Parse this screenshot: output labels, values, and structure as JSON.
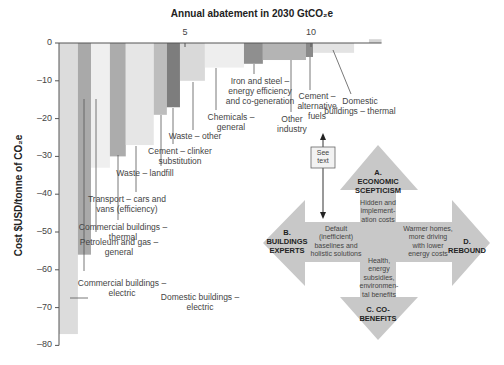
{
  "chart_data": {
    "type": "bar",
    "subtype": "marginal-abatement-cost-curve",
    "title": "Annual abatement in 2030 GtCO₂e",
    "xlabel": "Annual abatement in 2030 GtCO₂e",
    "ylabel": "Cost $USD/tonne of CO₂e",
    "x_ticks": [
      5,
      10
    ],
    "y_ticks": [
      0,
      -10,
      -20,
      -30,
      -40,
      -50,
      -60,
      -70,
      -80
    ],
    "ylim": [
      -80,
      2
    ],
    "xlim": [
      0,
      12.8
    ],
    "grid": false,
    "bars": [
      {
        "label": "Domestic buildings – electric",
        "x_start": 0.0,
        "width": 0.75,
        "value": -77,
        "color": "#dcdcdc"
      },
      {
        "label": "Commercial buildings – electric",
        "x_start": 0.75,
        "width": 0.52,
        "value": -56,
        "color": "#a9a9a9"
      },
      {
        "label": "Petroleum and gas – general",
        "x_start": 1.27,
        "width": 0.75,
        "value": -33,
        "color": "#efefef"
      },
      {
        "label": "Commercial buildings – thermal",
        "x_start": 2.02,
        "width": 0.63,
        "value": -30,
        "color": "#acacac"
      },
      {
        "label": "Transport – cars and vans (efficiency)",
        "x_start": 2.65,
        "width": 1.11,
        "value": -27,
        "color": "#e6e6e6"
      },
      {
        "label": "Waste – landfill",
        "x_start": 3.76,
        "width": 0.52,
        "value": -19,
        "color": "#bdbdbd"
      },
      {
        "label": "Cement – clinker substitution",
        "x_start": 4.28,
        "width": 0.52,
        "value": -17,
        "color": "#7d7d7d"
      },
      {
        "label": "Waste – other",
        "x_start": 4.8,
        "width": 0.99,
        "value": -10,
        "color": "#d9d9d9"
      },
      {
        "label": "Chemicals – general",
        "x_start": 5.79,
        "width": 1.55,
        "value": -6.5,
        "color": "#eeeeee"
      },
      {
        "label": "Iron and steel – energy efficiency and co-generation",
        "x_start": 7.34,
        "width": 0.75,
        "value": -5.5,
        "color": "#8f8f8f"
      },
      {
        "label": "Other industry",
        "x_start": 8.09,
        "width": 1.71,
        "value": -4.5,
        "color": "#b4b4b4"
      },
      {
        "label": "Cement – alternative fuels",
        "x_start": 9.8,
        "width": 0.28,
        "value": -3.7,
        "color": "#8a8a8a"
      },
      {
        "label": "Domestic buildings – thermal",
        "x_start": 10.08,
        "width": 1.63,
        "value": -2.6,
        "color": "#e3e3e3"
      },
      {
        "label": "",
        "x_start": 12.3,
        "width": 0.5,
        "value": 1,
        "color": "#d4d4d4"
      }
    ],
    "annotations": [
      {
        "text": "See text",
        "type": "box-with-double-arrow"
      }
    ]
  },
  "labels": {
    "title": "Annual abatement in 2030 GtCO₂e",
    "ylabel": "Cost $USD/tonne of CO₂e",
    "x_tick_5": "5",
    "x_tick_10": "10",
    "y_ticks": [
      "0",
      "–10",
      "–20",
      "–30",
      "–40",
      "–50",
      "–60",
      "–70",
      "–80"
    ],
    "bar_labels": {
      "domestic_electric": [
        "Domestic buildings –",
        "electric"
      ],
      "commercial_electric": [
        "Commercial buildings –",
        "electric"
      ],
      "petroleum": [
        "Petroleum and gas –",
        "general"
      ],
      "commercial_thermal": [
        "Commercial buildings –",
        "thermal"
      ],
      "transport": [
        "Transport – cars and",
        "vans (efficiency)"
      ],
      "waste_landfill": [
        "Waste – landfill"
      ],
      "cement_clinker": [
        "Cement – clinker",
        "substitution"
      ],
      "waste_other": [
        "Waste – other"
      ],
      "chemicals": [
        "Chemicals –",
        "general"
      ],
      "iron_steel": [
        "Iron and steel –",
        "energy efficiency",
        "and co-generation"
      ],
      "other_industry": [
        "Other",
        "industry"
      ],
      "cement_alt": [
        "Cement –",
        "alternative",
        "fuels"
      ],
      "domestic_thermal": [
        "Domestic",
        "buildings – thermal"
      ]
    },
    "see_text": [
      "See",
      "text"
    ]
  },
  "diagram": {
    "fill": "#c8c8c8",
    "a_title": [
      "A.",
      "ECONOMIC",
      "SCEPTICISM"
    ],
    "a_text": [
      "Hidden and",
      "implement-",
      "ation costs"
    ],
    "b_title": [
      "B.",
      "BUILDINGS",
      "EXPERTS"
    ],
    "b_text": [
      "Default",
      "(inefficient)",
      "baselines and",
      "holistic solutions"
    ],
    "c_title": [
      "C. CO-",
      "BENEFITS"
    ],
    "c_text": [
      "Health,",
      "energy",
      "subsidies,",
      "environmen-",
      "tal benefits"
    ],
    "d_title": [
      "D.",
      "REBOUND"
    ],
    "d_text": [
      "Warmer homes,",
      "more driving",
      "with lower",
      "energy costs"
    ]
  }
}
